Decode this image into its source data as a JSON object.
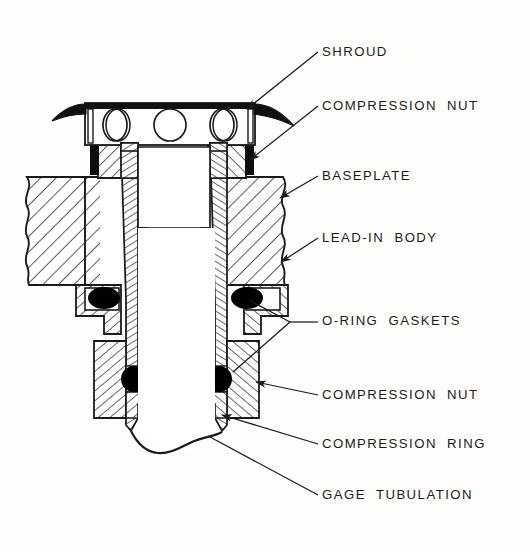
{
  "figure": {
    "background_color": "#fffefc",
    "line_color": "#1a1a1a",
    "hatch_color": "#1a1a1a",
    "oring_color": "#000000"
  },
  "callouts": [
    {
      "id": "shroud",
      "label": "SHROUD",
      "text_x": 322,
      "text_y": 56,
      "leader": "arrow"
    },
    {
      "id": "compression-nut-1",
      "label": "COMPRESSION  NUT",
      "text_x": 322,
      "text_y": 110,
      "leader": "arrow"
    },
    {
      "id": "baseplate",
      "label": "BASEPLATE",
      "text_x": 322,
      "text_y": 180,
      "leader": "arrow"
    },
    {
      "id": "lead-in-body",
      "label": "LEAD-IN  BODY",
      "text_x": 322,
      "text_y": 242,
      "leader": "arrow"
    },
    {
      "id": "o-ring-gaskets",
      "label": "O-RING  GASKETS",
      "text_x": 322,
      "text_y": 325,
      "leader": "fork"
    },
    {
      "id": "compression-nut-2",
      "label": "COMPRESSION  NUT",
      "text_x": 322,
      "text_y": 399,
      "leader": "arrow"
    },
    {
      "id": "compression-ring",
      "label": "COMPRESSION  RING",
      "text_x": 322,
      "text_y": 448,
      "leader": "arrow"
    },
    {
      "id": "gage-tubulation",
      "label": "GAGE  TUBULATION",
      "text_x": 322,
      "text_y": 499,
      "leader": "plain"
    }
  ],
  "parts": {
    "shroud": {
      "name": "shroud",
      "holes": 3,
      "hole_shape": "ellipse"
    },
    "compression_nut_upper": {
      "name": "compression nut (upper)"
    },
    "baseplate": {
      "name": "baseplate",
      "break_edges": [
        "left",
        "right"
      ]
    },
    "lead_in_body": {
      "name": "lead-in body"
    },
    "o_rings": {
      "name": "o-ring gaskets",
      "count": 4
    },
    "compression_nut_lower": {
      "name": "compression nut (lower)"
    },
    "compression_ring": {
      "name": "compression ring"
    },
    "gage_tubulation": {
      "name": "gage tubulation",
      "break_end": "bottom"
    }
  }
}
